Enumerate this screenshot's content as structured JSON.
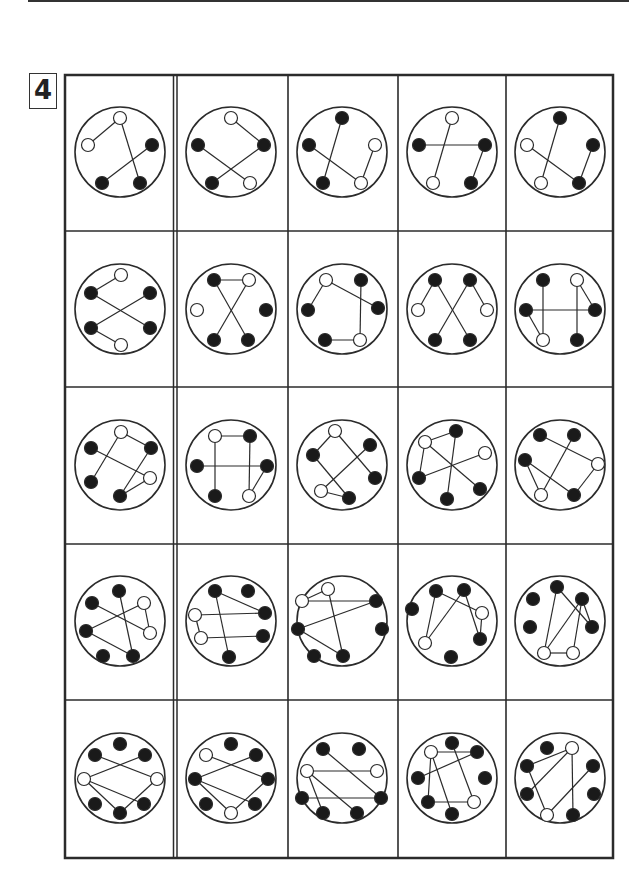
{
  "page": {
    "task_number": "4",
    "grid": {
      "rows": 5,
      "cols": 5
    }
  },
  "colors": {
    "line": "#2b2b2b",
    "filled_node": "#1a1a1a",
    "empty_node": "#ffffff"
  },
  "cells": [
    [
      {
        "nodes": [
          [
            0,
            -34,
            "w"
          ],
          [
            -32,
            -7,
            "w"
          ],
          [
            32,
            -7,
            "b"
          ],
          [
            -18,
            31,
            "b"
          ],
          [
            20,
            31,
            "b"
          ]
        ],
        "edges": [
          [
            0,
            1
          ],
          [
            0,
            4
          ],
          [
            2,
            3
          ]
        ]
      },
      {
        "nodes": [
          [
            0,
            -34,
            "w"
          ],
          [
            -33,
            -7,
            "b"
          ],
          [
            33,
            -7,
            "b"
          ],
          [
            -19,
            31,
            "b"
          ],
          [
            19,
            31,
            "w"
          ]
        ],
        "edges": [
          [
            0,
            2
          ],
          [
            1,
            4
          ],
          [
            3,
            2
          ]
        ]
      },
      {
        "nodes": [
          [
            0,
            -34,
            "b"
          ],
          [
            -33,
            -7,
            "b"
          ],
          [
            33,
            -7,
            "w"
          ],
          [
            -19,
            31,
            "b"
          ],
          [
            19,
            31,
            "w"
          ]
        ],
        "edges": [
          [
            0,
            3
          ],
          [
            1,
            4
          ],
          [
            4,
            2
          ]
        ]
      },
      {
        "nodes": [
          [
            0,
            -34,
            "w"
          ],
          [
            -33,
            -7,
            "b"
          ],
          [
            33,
            -7,
            "b"
          ],
          [
            -19,
            31,
            "w"
          ],
          [
            19,
            31,
            "b"
          ]
        ],
        "edges": [
          [
            1,
            2
          ],
          [
            0,
            3
          ],
          [
            2,
            4
          ]
        ]
      },
      {
        "nodes": [
          [
            0,
            -34,
            "b"
          ],
          [
            -33,
            -7,
            "w"
          ],
          [
            33,
            -7,
            "b"
          ],
          [
            -19,
            31,
            "w"
          ],
          [
            19,
            31,
            "b"
          ]
        ],
        "edges": [
          [
            0,
            3
          ],
          [
            1,
            4
          ],
          [
            2,
            4
          ]
        ]
      }
    ],
    [
      {
        "nodes": [
          [
            1,
            -34,
            "w"
          ],
          [
            -29,
            -16,
            "b"
          ],
          [
            30,
            -16,
            "b"
          ],
          [
            -29,
            19,
            "b"
          ],
          [
            30,
            19,
            "b"
          ],
          [
            1,
            36,
            "w"
          ]
        ],
        "edges": [
          [
            0,
            1
          ],
          [
            1,
            4
          ],
          [
            3,
            2
          ],
          [
            3,
            5
          ]
        ]
      },
      {
        "nodes": [
          [
            -17,
            -29,
            "b"
          ],
          [
            18,
            -29,
            "w"
          ],
          [
            -34,
            1,
            "w"
          ],
          [
            35,
            1,
            "b"
          ],
          [
            -17,
            31,
            "b"
          ],
          [
            17,
            31,
            "b"
          ]
        ],
        "edges": [
          [
            0,
            1
          ],
          [
            0,
            5
          ],
          [
            1,
            4
          ]
        ]
      },
      {
        "nodes": [
          [
            -16,
            -29,
            "w"
          ],
          [
            19,
            -29,
            "b"
          ],
          [
            -34,
            1,
            "b"
          ],
          [
            36,
            -1,
            "b"
          ],
          [
            -17,
            31,
            "b"
          ],
          [
            18,
            31,
            "w"
          ]
        ],
        "edges": [
          [
            0,
            2
          ],
          [
            0,
            3
          ],
          [
            1,
            5
          ],
          [
            4,
            5
          ]
        ]
      },
      {
        "nodes": [
          [
            -17,
            -29,
            "b"
          ],
          [
            18,
            -29,
            "b"
          ],
          [
            -34,
            1,
            "w"
          ],
          [
            35,
            1,
            "w"
          ],
          [
            -17,
            31,
            "b"
          ],
          [
            18,
            31,
            "b"
          ]
        ],
        "edges": [
          [
            0,
            2
          ],
          [
            0,
            5
          ],
          [
            1,
            4
          ],
          [
            1,
            3
          ]
        ]
      },
      {
        "nodes": [
          [
            -17,
            -29,
            "b"
          ],
          [
            17,
            -29,
            "w"
          ],
          [
            -34,
            1,
            "b"
          ],
          [
            35,
            1,
            "b"
          ],
          [
            -17,
            31,
            "w"
          ],
          [
            17,
            31,
            "b"
          ]
        ],
        "edges": [
          [
            0,
            4
          ],
          [
            2,
            3
          ],
          [
            2,
            4
          ],
          [
            1,
            3
          ],
          [
            1,
            5
          ]
        ]
      }
    ],
    [
      {
        "nodes": [
          [
            1,
            -33,
            "w"
          ],
          [
            -29,
            -17,
            "b"
          ],
          [
            31,
            -17,
            "b"
          ],
          [
            -29,
            17,
            "b"
          ],
          [
            30,
            13,
            "w"
          ],
          [
            0,
            31,
            "b"
          ]
        ],
        "edges": [
          [
            0,
            2
          ],
          [
            0,
            3
          ],
          [
            1,
            4
          ],
          [
            2,
            5
          ],
          [
            4,
            5
          ]
        ]
      },
      {
        "nodes": [
          [
            -16,
            -29,
            "w"
          ],
          [
            19,
            -29,
            "b"
          ],
          [
            -34,
            1,
            "b"
          ],
          [
            36,
            1,
            "b"
          ],
          [
            -16,
            31,
            "b"
          ],
          [
            18,
            31,
            "w"
          ]
        ],
        "edges": [
          [
            0,
            1
          ],
          [
            0,
            4
          ],
          [
            2,
            3
          ],
          [
            1,
            5
          ],
          [
            3,
            5
          ]
        ]
      },
      {
        "nodes": [
          [
            -7,
            -34,
            "w"
          ],
          [
            28,
            -20,
            "b"
          ],
          [
            -29,
            -10,
            "b"
          ],
          [
            33,
            13,
            "b"
          ],
          [
            -21,
            26,
            "w"
          ],
          [
            7,
            33,
            "b"
          ]
        ],
        "edges": [
          [
            0,
            2
          ],
          [
            0,
            3
          ],
          [
            1,
            4
          ],
          [
            2,
            5
          ],
          [
            4,
            5
          ]
        ]
      },
      {
        "nodes": [
          [
            -27,
            -23,
            "w"
          ],
          [
            4,
            -34,
            "b"
          ],
          [
            33,
            -12,
            "w"
          ],
          [
            -33,
            13,
            "b"
          ],
          [
            28,
            24,
            "b"
          ],
          [
            -5,
            34,
            "b"
          ]
        ],
        "edges": [
          [
            0,
            1
          ],
          [
            0,
            3
          ],
          [
            0,
            4
          ],
          [
            1,
            5
          ],
          [
            3,
            2
          ]
        ]
      },
      {
        "nodes": [
          [
            -20,
            -30,
            "b"
          ],
          [
            14,
            -30,
            "b"
          ],
          [
            38,
            -1,
            "w"
          ],
          [
            -35,
            -5,
            "b"
          ],
          [
            -19,
            30,
            "w"
          ],
          [
            14,
            30,
            "b"
          ]
        ],
        "edges": [
          [
            0,
            2
          ],
          [
            1,
            4
          ],
          [
            3,
            4
          ],
          [
            3,
            5
          ],
          [
            2,
            5
          ]
        ]
      }
    ],
    [
      {
        "nodes": [
          [
            -1,
            -30,
            "b"
          ],
          [
            -28,
            -18,
            "b"
          ],
          [
            24,
            -18,
            "w"
          ],
          [
            -34,
            10,
            "b"
          ],
          [
            30,
            12,
            "w"
          ],
          [
            -17,
            35,
            "b"
          ],
          [
            13,
            35,
            "b"
          ]
        ],
        "edges": [
          [
            0,
            6
          ],
          [
            1,
            4
          ],
          [
            2,
            4
          ],
          [
            3,
            2
          ],
          [
            3,
            6
          ]
        ]
      },
      {
        "nodes": [
          [
            -16,
            -30,
            "b"
          ],
          [
            17,
            -30,
            "b"
          ],
          [
            -36,
            -6,
            "w"
          ],
          [
            34,
            -8,
            "b"
          ],
          [
            -30,
            17,
            "w"
          ],
          [
            32,
            15,
            "b"
          ],
          [
            -2,
            36,
            "b"
          ]
        ],
        "edges": [
          [
            0,
            6
          ],
          [
            0,
            3
          ],
          [
            2,
            4
          ],
          [
            4,
            5
          ],
          [
            2,
            3
          ]
        ]
      },
      {
        "nodes": [
          [
            -14,
            -32,
            "w"
          ],
          [
            -40,
            -20,
            "w"
          ],
          [
            34,
            -20,
            "b"
          ],
          [
            -44,
            8,
            "b"
          ],
          [
            40,
            8,
            "b"
          ],
          [
            -28,
            35,
            "b"
          ],
          [
            1,
            35,
            "b"
          ]
        ],
        "edges": [
          [
            0,
            1
          ],
          [
            1,
            2
          ],
          [
            0,
            6
          ],
          [
            3,
            2
          ],
          [
            3,
            6
          ]
        ]
      },
      {
        "nodes": [
          [
            -16,
            -30,
            "b"
          ],
          [
            12,
            -31,
            "b"
          ],
          [
            -40,
            -12,
            "b"
          ],
          [
            30,
            -8,
            "w"
          ],
          [
            -27,
            22,
            "w"
          ],
          [
            28,
            18,
            "b"
          ],
          [
            -1,
            36,
            "b"
          ]
        ],
        "edges": [
          [
            0,
            4
          ],
          [
            0,
            3
          ],
          [
            1,
            4
          ],
          [
            1,
            5
          ],
          [
            3,
            5
          ]
        ]
      },
      {
        "nodes": [
          [
            -3,
            -34,
            "b"
          ],
          [
            -27,
            -22,
            "b"
          ],
          [
            22,
            -22,
            "b"
          ],
          [
            -30,
            6,
            "b"
          ],
          [
            32,
            6,
            "b"
          ],
          [
            -16,
            32,
            "w"
          ],
          [
            13,
            32,
            "w"
          ]
        ],
        "edges": [
          [
            0,
            5
          ],
          [
            0,
            4
          ],
          [
            2,
            4
          ],
          [
            2,
            5
          ],
          [
            2,
            6
          ],
          [
            5,
            6
          ]
        ]
      }
    ],
    [
      {
        "nodes": [
          [
            0,
            -34,
            "b"
          ],
          [
            -25,
            -23,
            "b"
          ],
          [
            25,
            -23,
            "b"
          ],
          [
            -36,
            1,
            "w"
          ],
          [
            37,
            1,
            "w"
          ],
          [
            -25,
            26,
            "b"
          ],
          [
            24,
            26,
            "b"
          ],
          [
            0,
            35,
            "b"
          ]
        ],
        "edges": [
          [
            1,
            4
          ],
          [
            2,
            3
          ],
          [
            3,
            6
          ],
          [
            3,
            7
          ],
          [
            4,
            7
          ]
        ]
      },
      {
        "nodes": [
          [
            0,
            -34,
            "b"
          ],
          [
            -25,
            -23,
            "w"
          ],
          [
            25,
            -23,
            "b"
          ],
          [
            -36,
            1,
            "b"
          ],
          [
            37,
            1,
            "b"
          ],
          [
            -25,
            26,
            "b"
          ],
          [
            24,
            26,
            "b"
          ],
          [
            0,
            35,
            "w"
          ]
        ],
        "edges": [
          [
            1,
            4
          ],
          [
            2,
            3
          ],
          [
            3,
            6
          ],
          [
            3,
            7
          ],
          [
            4,
            7
          ]
        ]
      },
      {
        "nodes": [
          [
            -19,
            -29,
            "b"
          ],
          [
            17,
            -29,
            "b"
          ],
          [
            -35,
            -7,
            "w"
          ],
          [
            35,
            -7,
            "w"
          ],
          [
            -40,
            20,
            "b"
          ],
          [
            39,
            20,
            "b"
          ],
          [
            -19,
            35,
            "b"
          ],
          [
            15,
            35,
            "b"
          ]
        ],
        "edges": [
          [
            2,
            3
          ],
          [
            0,
            5
          ],
          [
            4,
            5
          ],
          [
            2,
            6
          ],
          [
            2,
            7
          ]
        ]
      },
      {
        "nodes": [
          [
            -21,
            -26,
            "w"
          ],
          [
            0,
            -35,
            "b"
          ],
          [
            25,
            -26,
            "b"
          ],
          [
            -34,
            0,
            "b"
          ],
          [
            33,
            0,
            "b"
          ],
          [
            -24,
            24,
            "b"
          ],
          [
            22,
            24,
            "w"
          ],
          [
            0,
            36,
            "b"
          ]
        ],
        "edges": [
          [
            0,
            2
          ],
          [
            0,
            5
          ],
          [
            0,
            7
          ],
          [
            1,
            6
          ],
          [
            3,
            2
          ],
          [
            5,
            6
          ]
        ]
      },
      {
        "nodes": [
          [
            -13,
            -30,
            "b"
          ],
          [
            12,
            -30,
            "w"
          ],
          [
            -33,
            -12,
            "b"
          ],
          [
            33,
            -12,
            "b"
          ],
          [
            -33,
            16,
            "b"
          ],
          [
            34,
            16,
            "b"
          ],
          [
            -13,
            37,
            "w"
          ],
          [
            13,
            37,
            "b"
          ]
        ],
        "edges": [
          [
            2,
            1
          ],
          [
            4,
            1
          ],
          [
            2,
            6
          ],
          [
            1,
            7
          ],
          [
            3,
            6
          ]
        ]
      }
    ]
  ]
}
